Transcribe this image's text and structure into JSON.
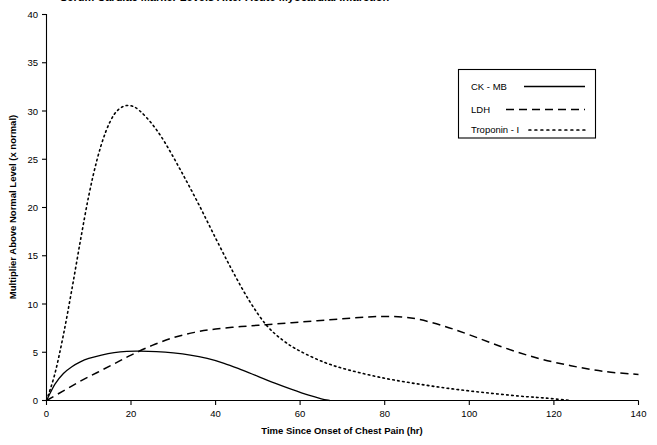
{
  "chart_data": {
    "type": "line",
    "title": "Serum Cardiac Marker Levels After Acute Myocardial Infarction",
    "title_truncated": true,
    "xlabel": "Time Since Onset of Chest Pain (hr)",
    "ylabel": "Multiplier Above Normal Level (x normal)",
    "xlim": [
      0,
      140
    ],
    "ylim": [
      0,
      40
    ],
    "xticks": [
      0,
      20,
      40,
      60,
      80,
      100,
      120,
      140
    ],
    "yticks": [
      0,
      5,
      10,
      15,
      20,
      25,
      30,
      35,
      40
    ],
    "grid": false,
    "legend_position": "upper right",
    "line_color": "#000000",
    "series": [
      {
        "name": "CK - MB",
        "style": "solid",
        "peak_value": 5.1,
        "peak_time": 22,
        "x": [
          0,
          2,
          4,
          6,
          8,
          10,
          13,
          16,
          19,
          22,
          26,
          30,
          34,
          38,
          42,
          46,
          50,
          54,
          58,
          62,
          65,
          67
        ],
        "values": [
          0,
          1.7,
          2.8,
          3.5,
          4.0,
          4.35,
          4.7,
          4.95,
          5.08,
          5.1,
          5.05,
          4.92,
          4.7,
          4.35,
          3.85,
          3.2,
          2.5,
          1.8,
          1.15,
          0.55,
          0.18,
          0
        ]
      },
      {
        "name": "LDH",
        "style": "dashed",
        "peak_value": 8.7,
        "peak_time": 80,
        "x": [
          0,
          4,
          8,
          12,
          16,
          20,
          25,
          30,
          35,
          40,
          46,
          52,
          58,
          64,
          70,
          76,
          80,
          84,
          88,
          94,
          100,
          108,
          116,
          124,
          132,
          140
        ],
        "values": [
          0,
          1.0,
          2.0,
          2.9,
          3.8,
          4.7,
          5.7,
          6.5,
          7.05,
          7.4,
          7.65,
          7.85,
          8.05,
          8.25,
          8.45,
          8.65,
          8.7,
          8.65,
          8.4,
          7.7,
          6.8,
          5.5,
          4.4,
          3.6,
          3.0,
          2.7
        ]
      },
      {
        "name": "Troponin - I",
        "style": "dotted",
        "peak_value": 30.5,
        "peak_time": 19,
        "x": [
          0,
          2,
          4,
          6,
          8,
          10,
          12,
          14,
          16,
          18,
          20,
          22,
          25,
          28,
          32,
          36,
          40,
          44,
          48,
          52,
          56,
          60,
          66,
          72,
          80,
          88,
          96,
          104,
          112,
          118,
          124
        ],
        "values": [
          0,
          2.8,
          6.8,
          11.5,
          16.5,
          21.2,
          25.0,
          27.8,
          29.6,
          30.4,
          30.5,
          30.0,
          28.6,
          26.7,
          23.6,
          20.3,
          16.8,
          13.4,
          10.3,
          7.8,
          6.2,
          5.1,
          3.9,
          3.1,
          2.3,
          1.7,
          1.2,
          0.8,
          0.45,
          0.25,
          0.0
        ]
      }
    ]
  },
  "legend": {
    "items": [
      {
        "label": "CK - MB",
        "style": "solid"
      },
      {
        "label": "LDH",
        "style": "dashed"
      },
      {
        "label": "Troponin - I",
        "style": "dotted"
      }
    ]
  },
  "axes": {
    "x": {
      "title": "Time Since Onset of Chest Pain (hr)",
      "tick_labels": [
        "0",
        "20",
        "40",
        "60",
        "80",
        "100",
        "120",
        "140"
      ]
    },
    "y": {
      "title": "Multiplier Above Normal Level (x normal)",
      "tick_labels": [
        "0",
        "5",
        "10",
        "15",
        "20",
        "25",
        "30",
        "35",
        "40"
      ]
    }
  }
}
